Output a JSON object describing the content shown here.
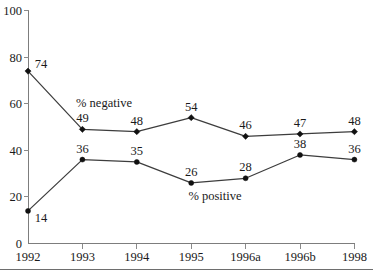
{
  "chart_data": {
    "type": "line",
    "title": "",
    "subtitle": "",
    "xlabel": "",
    "ylabel": "",
    "categories": [
      "1992",
      "1993",
      "1994",
      "1995",
      "1996a",
      "1996b",
      "1998"
    ],
    "ylim": [
      0,
      100
    ],
    "yticks": [
      0,
      20,
      40,
      60,
      80,
      100
    ],
    "ytick_labels": [
      "0",
      "20",
      "40",
      "60",
      "80",
      "100"
    ],
    "grid": false,
    "legend_position": "inline-annotation",
    "series": [
      {
        "name": "% negative",
        "values": [
          74,
          49,
          48,
          54,
          46,
          47,
          48
        ],
        "value_labels": [
          "74",
          "49",
          "48",
          "54",
          "46",
          "47",
          "48"
        ],
        "marker": "diamond",
        "color": "#111111"
      },
      {
        "name": "% positive",
        "values": [
          14,
          36,
          35,
          26,
          28,
          38,
          36
        ],
        "value_labels": [
          "14",
          "36",
          "35",
          "26",
          "28",
          "38",
          "36"
        ],
        "marker": "circle",
        "color": "#111111"
      }
    ],
    "annotations": [
      {
        "text": "% negative",
        "x_category": "1993",
        "y_value": 62
      },
      {
        "text": "% positive",
        "x_category": "1995",
        "y_value": 20
      }
    ]
  },
  "colors": {
    "axis": "#7d7d7d",
    "line": "#3d3d3d",
    "marker": "#111111",
    "text": "#1a1a1a",
    "background": "#ffffff"
  }
}
